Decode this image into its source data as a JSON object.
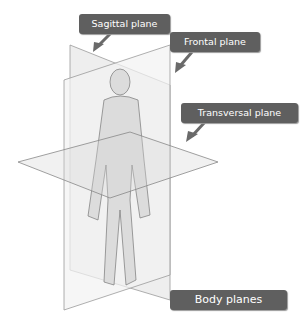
{
  "labels": {
    "sagittal": "Sagittal plane",
    "frontal": "Frontal plane",
    "transversal": "Transversal plane",
    "title": "Body planes"
  },
  "colors": {
    "label_bg": "#5f5f5f",
    "label_text": "#ffffff",
    "plane_line": "#9a9a9a",
    "plane_fill": "#ebebeb"
  }
}
